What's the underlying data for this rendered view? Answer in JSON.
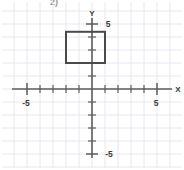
{
  "problem": {
    "number": "2)"
  },
  "chart_data": {
    "type": "scatter",
    "title": "",
    "xlabel": "X",
    "ylabel": "Y",
    "xlim": [
      -6.2,
      6.6
    ],
    "ylim": [
      -6.2,
      6.2
    ],
    "grid": true,
    "grid_color": "#e9e6f0",
    "axis_color": "#5c5c5c",
    "shape_color": "#4a4a4a",
    "x_axis_tick_values": [
      -5,
      -4,
      -3,
      -2,
      -1,
      1,
      2,
      3,
      4,
      5
    ],
    "y_axis_tick_values": [
      5,
      4,
      3,
      2,
      1,
      -1,
      -2,
      -3,
      -4,
      -5
    ],
    "x_tick_labels": [
      {
        "value": -5,
        "text": "-5"
      },
      {
        "value": 5,
        "text": "5"
      }
    ],
    "y_tick_labels": [
      {
        "value": 5,
        "text": "5"
      },
      {
        "value": -5,
        "text": "-5"
      }
    ],
    "unit_px": 13,
    "origin_px": {
      "x": 92,
      "y": 89
    },
    "shapes": [
      {
        "name": "rectangle",
        "type": "rect",
        "x_min": -2,
        "x_max": 1,
        "y_min": 2,
        "y_max": 4.4,
        "width_units": 3,
        "height_units": 2.4,
        "stroke": "#4a4a4a",
        "stroke_width": 2,
        "fill": "none"
      }
    ],
    "annotations": [
      {
        "text": "Y",
        "position": "y-axis-top"
      },
      {
        "text": "X",
        "position": "x-axis-right"
      }
    ]
  }
}
